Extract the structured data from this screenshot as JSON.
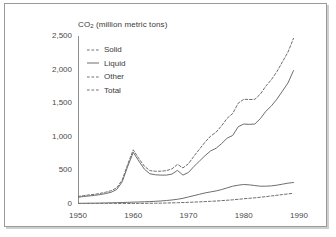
{
  "chart_data": {
    "type": "line",
    "title": "CO2 (million metric tons)",
    "title_main": "CO",
    "title_sub": "2",
    "title_rest": " (million metric tons)",
    "xlabel": "",
    "ylabel": "",
    "xlim": [
      1950,
      1990
    ],
    "ylim": [
      0,
      2500
    ],
    "yticks": [
      0,
      500,
      1000,
      1500,
      2000,
      2500
    ],
    "ytick_labels": [
      "0",
      "500",
      "1,000",
      "1,500",
      "2,000",
      "2,500"
    ],
    "xticks": [
      1950,
      1960,
      1970,
      1980,
      1990
    ],
    "xtick_labels": [
      "1950",
      "1960",
      "1970",
      "1980",
      "1990"
    ],
    "minor_xtick_interval": 1,
    "grid": false,
    "legend_position": "upper-left-inside",
    "line_color": "#6e6e6e",
    "axis_color": "#8f8f8f",
    "text_color": "#3a3a3a",
    "background": "#ffffff",
    "x": [
      1950,
      1951,
      1952,
      1953,
      1954,
      1955,
      1956,
      1957,
      1958,
      1959,
      1960,
      1961,
      1962,
      1963,
      1964,
      1965,
      1966,
      1967,
      1968,
      1969,
      1970,
      1971,
      1972,
      1973,
      1974,
      1975,
      1976,
      1977,
      1978,
      1979,
      1980,
      1981,
      1982,
      1983,
      1984,
      1985,
      1986,
      1987,
      1988,
      1989
    ],
    "series": [
      {
        "name": "Solid",
        "style": "solid",
        "values": [
          100,
          112,
          120,
          128,
          140,
          155,
          175,
          215,
          330,
          560,
          770,
          640,
          520,
          450,
          435,
          430,
          430,
          445,
          500,
          430,
          470,
          560,
          640,
          720,
          790,
          830,
          900,
          980,
          1020,
          1150,
          1190,
          1185,
          1190,
          1270,
          1380,
          1460,
          1560,
          1680,
          1800,
          1985
        ]
      },
      {
        "name": "Liquid",
        "style": "solid",
        "values": [
          10,
          11,
          12,
          13,
          14,
          16,
          18,
          20,
          22,
          25,
          28,
          30,
          33,
          36,
          40,
          45,
          52,
          60,
          70,
          85,
          105,
          125,
          145,
          165,
          180,
          195,
          215,
          240,
          265,
          280,
          290,
          285,
          275,
          265,
          265,
          270,
          280,
          295,
          310,
          320
        ]
      },
      {
        "name": "Other",
        "style": "dashed",
        "values": [
          2,
          2,
          3,
          3,
          4,
          4,
          5,
          5,
          6,
          7,
          8,
          9,
          10,
          11,
          12,
          13,
          15,
          17,
          19,
          22,
          25,
          28,
          32,
          36,
          40,
          44,
          50,
          56,
          62,
          70,
          78,
          85,
          92,
          100,
          110,
          120,
          130,
          140,
          150,
          160
        ]
      },
      {
        "name": "Total",
        "style": "dashed",
        "values": [
          112,
          125,
          135,
          144,
          158,
          175,
          198,
          240,
          358,
          592,
          806,
          679,
          563,
          497,
          487,
          488,
          497,
          522,
          589,
          537,
          600,
          713,
          817,
          921,
          1010,
          1069,
          1165,
          1276,
          1347,
          1500,
          1558,
          1555,
          1557,
          1635,
          1755,
          1850,
          1970,
          2115,
          2260,
          2465
        ]
      }
    ]
  },
  "legend": {
    "items": [
      {
        "label": "Solid",
        "style": "dashed"
      },
      {
        "label": "Liquid",
        "style": "solid"
      },
      {
        "label": "Other",
        "style": "dashed"
      },
      {
        "label": "Total",
        "style": "dashed"
      }
    ]
  }
}
